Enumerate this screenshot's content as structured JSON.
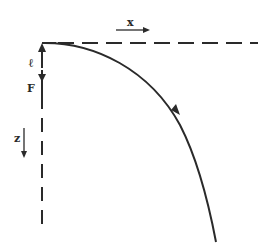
{
  "diagram": {
    "type": "trajectory-diagram",
    "colors": {
      "stroke": "#2a2a2a",
      "background": "#ffffff"
    },
    "labels": {
      "x_axis": "x",
      "z_axis": "z",
      "length": "ℓ",
      "force": "F"
    },
    "elements": [
      {
        "name": "horizontal-dashed-axis",
        "direction": "x"
      },
      {
        "name": "vertical-dashed-axis",
        "direction": "z"
      },
      {
        "name": "curved-trajectory",
        "has_direction_arrow": true
      },
      {
        "name": "length-arrow-up",
        "label": "ℓ"
      },
      {
        "name": "force-arrow-down",
        "label": "F"
      },
      {
        "name": "x-direction-arrow",
        "label": "x"
      },
      {
        "name": "z-direction-arrow",
        "label": "z"
      }
    ]
  }
}
